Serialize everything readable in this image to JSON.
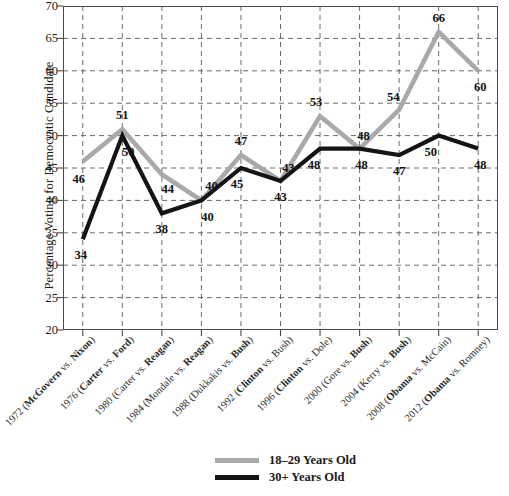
{
  "chart_data": {
    "type": "line",
    "title": "",
    "xlabel": "",
    "ylabel": "Percentage Voting for Democratic Candidate",
    "ylim": [
      20,
      70
    ],
    "ytick_step": 5,
    "yticks": [
      70,
      65,
      60,
      55,
      50,
      45,
      40,
      35,
      30,
      25,
      20
    ],
    "grid": true,
    "grid_style": "dashed",
    "legend_position": "bottom-center",
    "categories": [
      "1972 (McGovern vs. Nixon)",
      "1976 (Carter vs. Ford)",
      "1980 (Carter vs. Reagan)",
      "1984 (Mondale vs. Reagan)",
      "1988 (Dukkakis vs. Bush)",
      "1992 (Clinton vs. Bush)",
      "1996 (Clinton vs. Dole)",
      "2000 (Gore vs. Bush)",
      "2004 (Kerry vs. Bush)",
      "2008 (Obama vs. McCain)",
      "2012 (Obama vs. Romney)"
    ],
    "categories_rich": [
      {
        "plain": "1972 (",
        "bold": "McGovern",
        "mid": " vs. ",
        "bold2": "Nixon",
        "tail": ")"
      },
      {
        "plain": "1976 (",
        "bold": "Carter",
        "mid": " vs. ",
        "bold2": "Ford",
        "tail": ")"
      },
      {
        "plain": "1980 (Carter vs. ",
        "bold": "Reagan",
        "mid": "",
        "bold2": "",
        "tail": ")"
      },
      {
        "plain": "1984 (Mondale vs. ",
        "bold": "Reagan",
        "mid": "",
        "bold2": "",
        "tail": ")"
      },
      {
        "plain": "1988 (Dukkakis vs. ",
        "bold": "Bush",
        "mid": "",
        "bold2": "",
        "tail": ")"
      },
      {
        "plain": "1992 (",
        "bold": "Clinton",
        "mid": " vs. Bush",
        "bold2": "",
        "tail": ")"
      },
      {
        "plain": "1996 (",
        "bold": "Clinton",
        "mid": " vs. Dole",
        "bold2": "",
        "tail": ")"
      },
      {
        "plain": "2000 (Gore vs. ",
        "bold": "Bush",
        "mid": "",
        "bold2": "",
        "tail": ")"
      },
      {
        "plain": "2004 (Kerry vs. ",
        "bold": "Bush",
        "mid": "",
        "bold2": "",
        "tail": ")"
      },
      {
        "plain": "2008 (",
        "bold": "Obama",
        "mid": " vs. McCain",
        "bold2": "",
        "tail": ")"
      },
      {
        "plain": "2012 (",
        "bold": "Obama",
        "mid": " vs. Romney",
        "bold2": "",
        "tail": ")"
      }
    ],
    "series": [
      {
        "name": "18–29 Years Old",
        "color": "#a9a9a9",
        "values": [
          46,
          51,
          44,
          40,
          47,
          43,
          53,
          48,
          54,
          66,
          60
        ],
        "label_offsets": [
          {
            "dx": -4,
            "dy": 17
          },
          {
            "dx": 0,
            "dy": -14
          },
          {
            "dx": 6,
            "dy": 15
          },
          {
            "dx": 10,
            "dy": -14
          },
          {
            "dx": 0,
            "dy": -14
          },
          {
            "dx": 8,
            "dy": -13
          },
          {
            "dx": -4,
            "dy": -14
          },
          {
            "dx": 4,
            "dy": -13
          },
          {
            "dx": -6,
            "dy": -13
          },
          {
            "dx": 0,
            "dy": -14
          },
          {
            "dx": 2,
            "dy": 16
          }
        ]
      },
      {
        "name": "30+ Years Old",
        "color": "#141414",
        "values": [
          34,
          50,
          38,
          40,
          45,
          43,
          48,
          48,
          47,
          50,
          48
        ],
        "label_offsets": [
          {
            "dx": -2,
            "dy": 16
          },
          {
            "dx": 6,
            "dy": 16
          },
          {
            "dx": 0,
            "dy": 16
          },
          {
            "dx": 6,
            "dy": 17
          },
          {
            "dx": -4,
            "dy": 16
          },
          {
            "dx": 0,
            "dy": 16
          },
          {
            "dx": -6,
            "dy": 16
          },
          {
            "dx": 2,
            "dy": 16
          },
          {
            "dx": 0,
            "dy": 16
          },
          {
            "dx": -8,
            "dy": 16
          },
          {
            "dx": 2,
            "dy": 16
          }
        ]
      }
    ]
  },
  "legend": {
    "entries": [
      {
        "label": "18–29 Years Old",
        "color": "#a9a9a9"
      },
      {
        "label": "30+ Years Old",
        "color": "#141414"
      }
    ]
  },
  "caption": {
    "text": ""
  }
}
